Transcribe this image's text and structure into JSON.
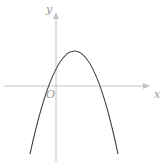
{
  "diagram": {
    "type": "function-graph",
    "labels": {
      "x_axis": "x",
      "y_axis": "y",
      "origin": "O"
    },
    "colors": {
      "axis": "#c4c4c4",
      "curve": "#3a3a3a",
      "label": "#9a9a9a",
      "background": "#ffffff"
    },
    "curve": {
      "shape": "parabola",
      "opens": "down",
      "vertex_quadrant": "first",
      "x_intercepts": [
        "negative",
        "positive"
      ],
      "y_intercept": "positive"
    }
  }
}
